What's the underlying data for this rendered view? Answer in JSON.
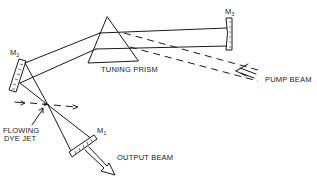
{
  "diagram": {
    "labels": {
      "tuning_prism": "TUNING PRISM",
      "pump_beam": "PUMP BEAM",
      "output_beam": "OUTPUT BEAM",
      "flowing_dye_jet_line1": "FLOWING",
      "flowing_dye_jet_line2": "DYE JET",
      "mirror_m1": "M",
      "mirror_m1_sub": "1",
      "mirror_m2": "M",
      "mirror_m2_sub": "2",
      "mirror_m3": "M",
      "mirror_m3_sub": "3"
    },
    "components": [
      {
        "id": "M1",
        "type": "curved mirror",
        "role": "output coupler"
      },
      {
        "id": "M2",
        "type": "curved mirror",
        "role": "folding mirror"
      },
      {
        "id": "M3",
        "type": "flat mirror",
        "role": "end mirror"
      },
      {
        "id": "prism",
        "type": "prism",
        "role": "wavelength tuning"
      },
      {
        "id": "dye_jet",
        "type": "gain medium",
        "role": "flowing dye jet"
      }
    ],
    "colors": {
      "ink": "#1a1a1a",
      "background": "#ffffff"
    }
  }
}
